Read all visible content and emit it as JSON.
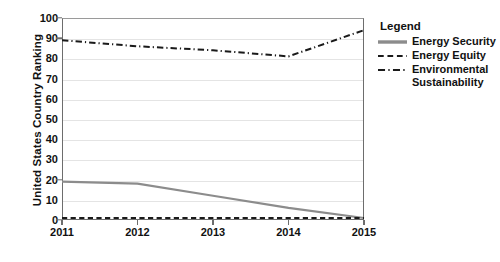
{
  "chart_data": {
    "type": "line",
    "title": "",
    "xlabel": "",
    "ylabel": "United States Country Ranking",
    "x": [
      2011,
      2012,
      2013,
      2014,
      2015
    ],
    "xtick_labels": [
      "2011",
      "2012",
      "2013",
      "2014",
      "2015"
    ],
    "ytick_labels": [
      "0",
      "10",
      "20",
      "30",
      "40",
      "50",
      "60",
      "70",
      "80",
      "90",
      "100"
    ],
    "ylim": [
      0,
      100
    ],
    "xlim": [
      2011,
      2015
    ],
    "grid": "horizontal",
    "legend_position": "right",
    "legend_title": "Legend",
    "series": [
      {
        "name": "Energy Security",
        "style": "solid",
        "color": "#8c8c8c",
        "values": [
          19,
          18,
          12,
          6,
          1
        ]
      },
      {
        "name": "Energy Equity",
        "style": "dashed",
        "color": "#1a1a1a",
        "values": [
          1,
          1,
          1,
          1,
          1
        ]
      },
      {
        "name": "Environmental Sustainability",
        "style": "dash-dot",
        "color": "#1a1a1a",
        "values": [
          89,
          86,
          84,
          81,
          94
        ]
      }
    ]
  },
  "legend": {
    "title": "Legend",
    "items": [
      {
        "label": "Energy Security"
      },
      {
        "label": "Energy Equity"
      },
      {
        "label": "Environmental Sustainability"
      }
    ]
  }
}
